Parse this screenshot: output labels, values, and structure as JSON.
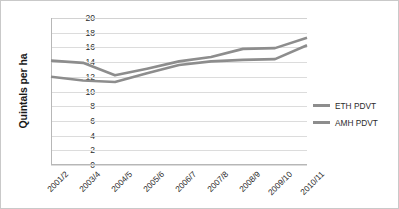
{
  "chart_data": {
    "type": "line",
    "title": "",
    "xlabel": "",
    "ylabel": "Quintals per ha",
    "ylim": [
      0,
      20
    ],
    "ytick_step": 2,
    "yticks": [
      "20",
      "18",
      "16",
      "14",
      "12",
      "10",
      "8",
      "6",
      "4",
      "2",
      "0"
    ],
    "grid": true,
    "legend_position": "right",
    "categories": [
      "2001/2",
      "2003/4",
      "2004/5",
      "2005/6",
      "2006/7",
      "2007/8",
      "2008/9",
      "2009/10",
      "2010/11"
    ],
    "series": [
      {
        "name": "ETH PDVT",
        "color": "#8d8d8d",
        "values": [
          14.2,
          13.9,
          12.2,
          13.1,
          14.1,
          14.7,
          15.8,
          15.9,
          17.3
        ]
      },
      {
        "name": "AMH PDVT",
        "color": "#8d8d8d",
        "values": [
          12.0,
          11.5,
          11.3,
          12.5,
          13.6,
          14.1,
          14.3,
          14.4,
          16.3
        ]
      }
    ]
  },
  "legend": {
    "entries": [
      {
        "label": "ETH PDVT",
        "color": "#8d8d8d"
      },
      {
        "label": "AMH PDVT",
        "color": "#8d8d8d"
      }
    ]
  },
  "axes": {
    "y_title": "Quintals per ha"
  },
  "colors": {
    "grid": "#dcdcdc",
    "axis": "#b7b7b7",
    "border": "#c9c9c9",
    "series": "#8d8d8d",
    "text": "#2b2b2b"
  }
}
